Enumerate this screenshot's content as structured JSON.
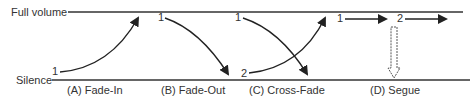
{
  "axis": {
    "top_label": "Full volume",
    "bottom_label": "Silence"
  },
  "panels": [
    {
      "caption": "(A) Fade-In",
      "markers": [
        "1"
      ]
    },
    {
      "caption": "(B) Fade-Out",
      "markers": [
        "1"
      ]
    },
    {
      "caption": "(C) Cross-Fade",
      "markers": [
        "1",
        "2"
      ]
    },
    {
      "caption": "(D) Segue",
      "markers": [
        "1",
        "2"
      ]
    }
  ],
  "colors": {
    "line": "#2a2a2a",
    "text": "#333333"
  }
}
